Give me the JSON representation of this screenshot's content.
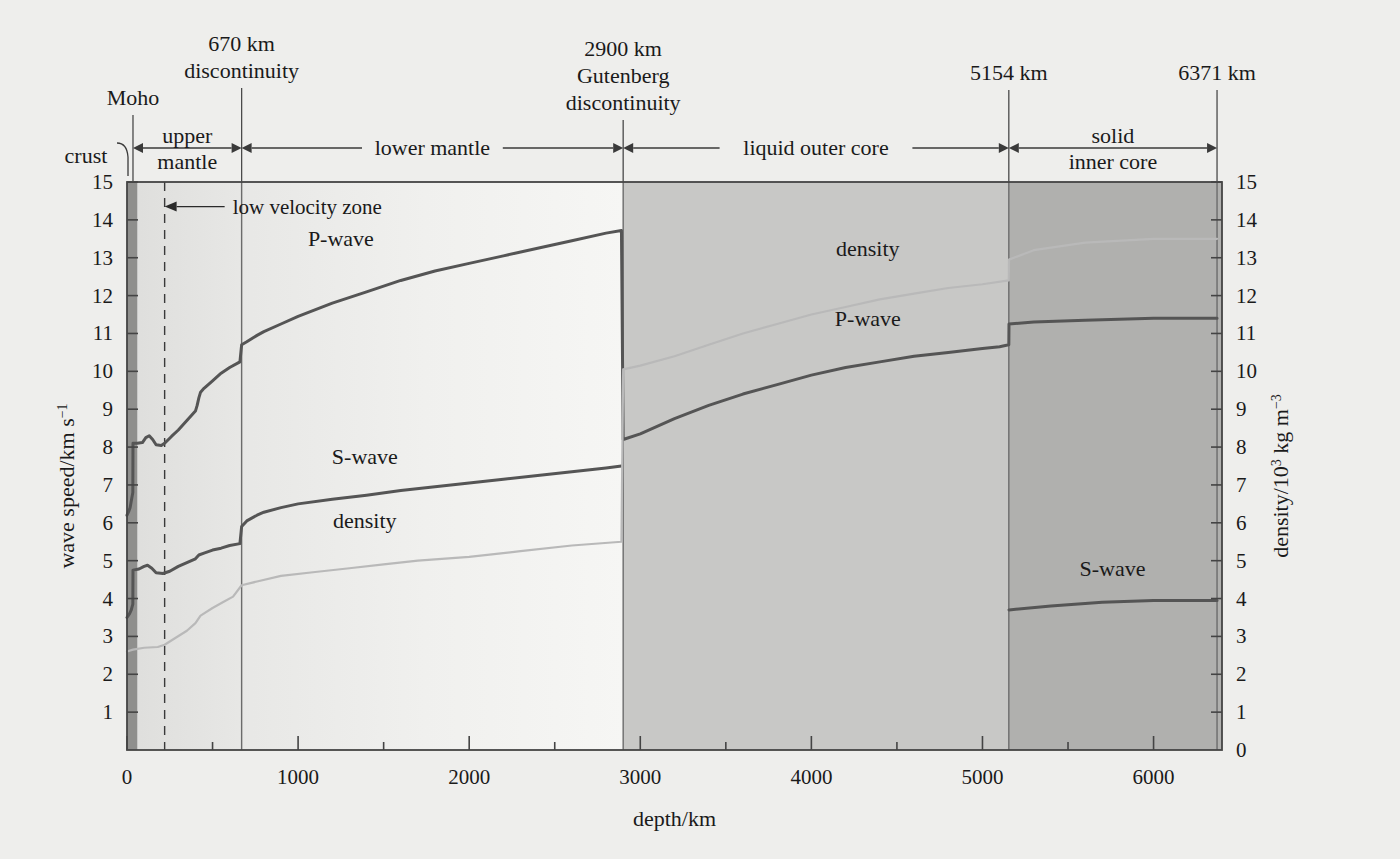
{
  "figure": {
    "background_color": "#eeeeec",
    "plot_background_mantle": "#f1f1ef",
    "plot_background_outer_core": "#c8c8c6",
    "plot_background_inner_core": "#b0b0ae",
    "plot_background_crust": "#8f8f8d",
    "curve_color": "#555555",
    "density_color": "#b9b9b9",
    "axis_color": "#444444"
  },
  "axes": {
    "x": {
      "title": "depth/km",
      "min": 0,
      "max": 6400,
      "ticks": [
        0,
        1000,
        2000,
        3000,
        4000,
        5000,
        6000
      ],
      "tick_labels": [
        "0",
        "1000",
        "2000",
        "3000",
        "4000",
        "5000",
        "6000"
      ],
      "minor_tick_step": 500
    },
    "y_left": {
      "title": "wave speed/km s",
      "title_exponent": "−1",
      "min": 0,
      "max": 15,
      "ticks": [
        0,
        1,
        2,
        3,
        4,
        5,
        6,
        7,
        8,
        9,
        10,
        11,
        12,
        13,
        14,
        15
      ],
      "tick_labels": [
        "",
        "1",
        "2",
        "3",
        "4",
        "5",
        "6",
        "7",
        "8",
        "9",
        "10",
        "11",
        "12",
        "13",
        "14",
        "15"
      ]
    },
    "y_right": {
      "title_pre": "density/10",
      "title_exponent": "3",
      "title_post": " kg m",
      "title_exponent2": "−3",
      "min": 0,
      "max": 15,
      "ticks": [
        0,
        1,
        2,
        3,
        4,
        5,
        6,
        7,
        8,
        9,
        10,
        11,
        12,
        13,
        14,
        15
      ],
      "tick_labels": [
        "0",
        "1",
        "2",
        "3",
        "4",
        "5",
        "6",
        "7",
        "8",
        "9",
        "10",
        "11",
        "12",
        "13",
        "14",
        "15"
      ]
    }
  },
  "boundaries": [
    {
      "name": "moho",
      "depth": 35,
      "label_lines": [
        "Moho"
      ]
    },
    {
      "name": "670km-discontinuity",
      "depth": 670,
      "label_lines": [
        "670 km",
        "discontinuity"
      ]
    },
    {
      "name": "gutenberg-discontinuity",
      "depth": 2900,
      "label_lines": [
        "2900 km",
        "Gutenberg",
        "discontinuity"
      ]
    },
    {
      "name": "inner-core-boundary",
      "depth": 5154,
      "label_lines": [
        "5154 km"
      ]
    },
    {
      "name": "earth-centre",
      "depth": 6371,
      "label_lines": [
        "6371 km"
      ]
    }
  ],
  "regions": [
    {
      "name": "crust",
      "label_lines": [
        "crust"
      ],
      "from": 0,
      "to": 35,
      "leader": true
    },
    {
      "name": "upper-mantle",
      "label_lines": [
        "upper",
        "mantle"
      ],
      "from": 35,
      "to": 670
    },
    {
      "name": "lower-mantle",
      "label_lines": [
        "lower mantle"
      ],
      "from": 670,
      "to": 2900
    },
    {
      "name": "liquid-outer-core",
      "label_lines": [
        "liquid outer core"
      ],
      "from": 2900,
      "to": 5154
    },
    {
      "name": "solid-inner-core",
      "label_lines": [
        "solid",
        "inner core"
      ],
      "from": 5154,
      "to": 6371
    }
  ],
  "annotations": [
    {
      "name": "low-velocity-zone",
      "text": "low velocity zone",
      "depth_marker": 220,
      "value": 14.35
    }
  ],
  "curve_labels": [
    {
      "name": "p-wave-mantle",
      "text": "P-wave",
      "depth": 1250,
      "value": 13.3
    },
    {
      "name": "s-wave-mantle",
      "text": "S-wave",
      "depth": 1390,
      "value": 7.55
    },
    {
      "name": "density-mantle",
      "text": "density",
      "depth": 1390,
      "value": 5.85
    },
    {
      "name": "density-outer-core",
      "text": "density",
      "depth": 4330,
      "value": 13.05
    },
    {
      "name": "p-wave-outer-core",
      "text": "P-wave",
      "depth": 4330,
      "value": 11.2
    },
    {
      "name": "s-wave-inner-core",
      "text": "S-wave",
      "depth": 5760,
      "value": 4.6
    }
  ],
  "chart_data": {
    "type": "line",
    "title": "",
    "xlabel": "depth/km",
    "ylabel": "wave speed/km s−1",
    "ylabel_right": "density/10³ kg m−3",
    "xlim": [
      0,
      6400
    ],
    "ylim": [
      0,
      15
    ],
    "grid": false,
    "legend": "inline labels on curves",
    "series": [
      {
        "name": "P-wave",
        "unit": "km s^-1",
        "points": [
          [
            0,
            6.2
          ],
          [
            10,
            6.3
          ],
          [
            18,
            6.4
          ],
          [
            26,
            6.6
          ],
          [
            34,
            6.8
          ],
          [
            35,
            8.1
          ],
          [
            60,
            8.1
          ],
          [
            90,
            8.12
          ],
          [
            110,
            8.25
          ],
          [
            130,
            8.3
          ],
          [
            150,
            8.2
          ],
          [
            170,
            8.06
          ],
          [
            200,
            8.04
          ],
          [
            220,
            8.1
          ],
          [
            260,
            8.28
          ],
          [
            300,
            8.45
          ],
          [
            350,
            8.7
          ],
          [
            400,
            8.95
          ],
          [
            410,
            9.1
          ],
          [
            420,
            9.3
          ],
          [
            430,
            9.45
          ],
          [
            450,
            9.55
          ],
          [
            500,
            9.75
          ],
          [
            550,
            9.95
          ],
          [
            600,
            10.1
          ],
          [
            660,
            10.25
          ],
          [
            670,
            10.7
          ],
          [
            700,
            10.78
          ],
          [
            760,
            10.95
          ],
          [
            800,
            11.05
          ],
          [
            900,
            11.25
          ],
          [
            1000,
            11.45
          ],
          [
            1200,
            11.8
          ],
          [
            1400,
            12.1
          ],
          [
            1600,
            12.4
          ],
          [
            1800,
            12.65
          ],
          [
            2000,
            12.85
          ],
          [
            2200,
            13.05
          ],
          [
            2400,
            13.25
          ],
          [
            2600,
            13.45
          ],
          [
            2800,
            13.65
          ],
          [
            2890,
            13.72
          ],
          [
            2900,
            8.2
          ],
          [
            3000,
            8.35
          ],
          [
            3200,
            8.75
          ],
          [
            3400,
            9.1
          ],
          [
            3600,
            9.4
          ],
          [
            3800,
            9.65
          ],
          [
            4000,
            9.9
          ],
          [
            4200,
            10.1
          ],
          [
            4400,
            10.25
          ],
          [
            4600,
            10.4
          ],
          [
            4800,
            10.5
          ],
          [
            5000,
            10.6
          ],
          [
            5100,
            10.65
          ],
          [
            5154,
            10.7
          ],
          [
            5155,
            11.25
          ],
          [
            5300,
            11.3
          ],
          [
            5600,
            11.35
          ],
          [
            6000,
            11.4
          ],
          [
            6371,
            11.4
          ]
        ]
      },
      {
        "name": "S-wave",
        "unit": "km s^-1",
        "points": [
          [
            0,
            3.5
          ],
          [
            15,
            3.6
          ],
          [
            25,
            3.7
          ],
          [
            34,
            3.85
          ],
          [
            35,
            4.75
          ],
          [
            70,
            4.78
          ],
          [
            100,
            4.85
          ],
          [
            120,
            4.88
          ],
          [
            145,
            4.8
          ],
          [
            170,
            4.68
          ],
          [
            210,
            4.66
          ],
          [
            250,
            4.72
          ],
          [
            300,
            4.85
          ],
          [
            350,
            4.95
          ],
          [
            400,
            5.05
          ],
          [
            420,
            5.15
          ],
          [
            450,
            5.2
          ],
          [
            500,
            5.28
          ],
          [
            550,
            5.33
          ],
          [
            600,
            5.4
          ],
          [
            660,
            5.45
          ],
          [
            670,
            5.9
          ],
          [
            700,
            6.05
          ],
          [
            760,
            6.2
          ],
          [
            800,
            6.28
          ],
          [
            900,
            6.4
          ],
          [
            1000,
            6.5
          ],
          [
            1200,
            6.62
          ],
          [
            1400,
            6.73
          ],
          [
            1600,
            6.85
          ],
          [
            1800,
            6.95
          ],
          [
            2000,
            7.05
          ],
          [
            2200,
            7.15
          ],
          [
            2400,
            7.25
          ],
          [
            2600,
            7.35
          ],
          [
            2800,
            7.45
          ],
          [
            2890,
            7.5
          ],
          [
            2900,
            0
          ],
          [
            5154,
            0
          ],
          [
            5155,
            3.7
          ],
          [
            5400,
            3.8
          ],
          [
            5700,
            3.9
          ],
          [
            6000,
            3.95
          ],
          [
            6371,
            3.95
          ]
        ],
        "note": "S-wave does not propagate through the liquid outer core (2900-5154 km)"
      },
      {
        "name": "density",
        "unit": "10^3 kg m^-3",
        "points": [
          [
            0,
            2.6
          ],
          [
            35,
            2.65
          ],
          [
            100,
            2.7
          ],
          [
            180,
            2.72
          ],
          [
            220,
            2.78
          ],
          [
            280,
            2.95
          ],
          [
            350,
            3.15
          ],
          [
            400,
            3.35
          ],
          [
            430,
            3.55
          ],
          [
            500,
            3.75
          ],
          [
            560,
            3.9
          ],
          [
            620,
            4.05
          ],
          [
            670,
            4.35
          ],
          [
            760,
            4.45
          ],
          [
            900,
            4.6
          ],
          [
            1100,
            4.7
          ],
          [
            1300,
            4.8
          ],
          [
            1500,
            4.9
          ],
          [
            1700,
            5.0
          ],
          [
            2000,
            5.1
          ],
          [
            2300,
            5.25
          ],
          [
            2600,
            5.4
          ],
          [
            2890,
            5.5
          ],
          [
            2900,
            10.05
          ],
          [
            3000,
            10.15
          ],
          [
            3200,
            10.4
          ],
          [
            3400,
            10.7
          ],
          [
            3600,
            11.0
          ],
          [
            3800,
            11.25
          ],
          [
            4000,
            11.5
          ],
          [
            4200,
            11.7
          ],
          [
            4400,
            11.9
          ],
          [
            4600,
            12.05
          ],
          [
            4800,
            12.2
          ],
          [
            5000,
            12.3
          ],
          [
            5154,
            12.4
          ],
          [
            5155,
            12.95
          ],
          [
            5300,
            13.2
          ],
          [
            5600,
            13.4
          ],
          [
            6000,
            13.5
          ],
          [
            6371,
            13.5
          ]
        ]
      }
    ]
  }
}
